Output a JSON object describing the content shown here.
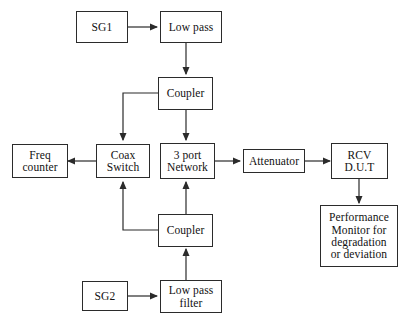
{
  "diagram": {
    "background_color": "#ffffff",
    "line_color": "#2b2b2b",
    "text_color": "#111111",
    "caption": "",
    "nodes": [
      {
        "id": "sg1",
        "label_lines": [
          "SG1"
        ]
      },
      {
        "id": "lowpass1",
        "label_lines": [
          "Low pass"
        ]
      },
      {
        "id": "coupler1",
        "label_lines": [
          "Coupler"
        ]
      },
      {
        "id": "freq",
        "label_lines": [
          "Freq",
          "counter"
        ]
      },
      {
        "id": "coax",
        "label_lines": [
          "Coax",
          "Switch"
        ]
      },
      {
        "id": "network",
        "label_lines": [
          "3 port",
          "Network"
        ]
      },
      {
        "id": "atten",
        "label_lines": [
          "Attenuator"
        ]
      },
      {
        "id": "rcv",
        "label_lines": [
          "RCV",
          "D.U.T"
        ]
      },
      {
        "id": "perf",
        "label_lines": [
          "Performance",
          "Monitor for",
          "degradation",
          "or deviation"
        ]
      },
      {
        "id": "coupler2",
        "label_lines": [
          "Coupler"
        ]
      },
      {
        "id": "sg2",
        "label_lines": [
          "SG2"
        ]
      },
      {
        "id": "lowpass2",
        "label_lines": [
          "Low pass",
          "filter"
        ]
      }
    ],
    "connections": [
      {
        "from": "sg1",
        "to": "lowpass1",
        "direction": "right"
      },
      {
        "from": "lowpass1",
        "to": "coupler1",
        "direction": "down"
      },
      {
        "from": "coupler1",
        "to": "coax",
        "direction": "left-down"
      },
      {
        "from": "coupler1",
        "to": "network",
        "direction": "down"
      },
      {
        "from": "coax",
        "to": "freq",
        "direction": "left"
      },
      {
        "from": "network",
        "to": "atten",
        "direction": "right"
      },
      {
        "from": "atten",
        "to": "rcv",
        "direction": "right"
      },
      {
        "from": "rcv",
        "to": "perf",
        "direction": "down"
      },
      {
        "from": "coupler2",
        "to": "coax",
        "direction": "left-up"
      },
      {
        "from": "coupler2",
        "to": "network",
        "direction": "up"
      },
      {
        "from": "lowpass2",
        "to": "coupler2",
        "direction": "up"
      },
      {
        "from": "sg2",
        "to": "lowpass2",
        "direction": "right"
      }
    ]
  }
}
